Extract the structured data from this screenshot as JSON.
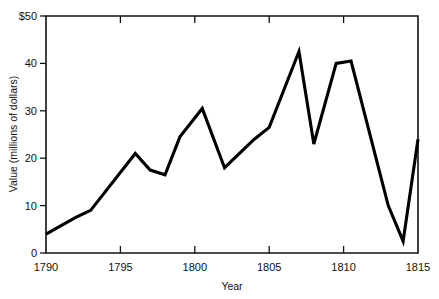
{
  "chart_data": {
    "type": "line",
    "title": "",
    "xlabel": "Year",
    "ylabel": "Value (millions of dollars)",
    "xlim": [
      1790,
      1815
    ],
    "ylim": [
      0,
      50
    ],
    "grid": false,
    "legend": null,
    "xticks": [
      1790,
      1795,
      1800,
      1805,
      1810,
      1815
    ],
    "xticklabels": [
      "1790",
      "1795",
      "1800",
      "1805",
      "1810",
      "1815"
    ],
    "yticks": [
      0,
      10,
      20,
      30,
      40,
      50
    ],
    "yticklabels": [
      "0",
      "10",
      "20",
      "30",
      "40",
      "$50"
    ],
    "series": [
      {
        "name": "Value",
        "color": "#000000",
        "x": [
          1790,
          1792,
          1793,
          1796,
          1797,
          1798,
          1799,
          1800.5,
          1802,
          1804,
          1805,
          1807,
          1808,
          1809.5,
          1810.5,
          1813,
          1814,
          1815
        ],
        "values": [
          4.0,
          7.5,
          9.0,
          21.0,
          17.5,
          16.5,
          24.5,
          30.5,
          18.0,
          24.0,
          26.5,
          42.5,
          23.0,
          40.0,
          40.5,
          10.0,
          2.5,
          24.0
        ]
      }
    ]
  },
  "axis": {
    "y_tick_prefix": "$",
    "x_axis_label": "Year",
    "y_axis_label": "Value (millions of dollars)"
  }
}
